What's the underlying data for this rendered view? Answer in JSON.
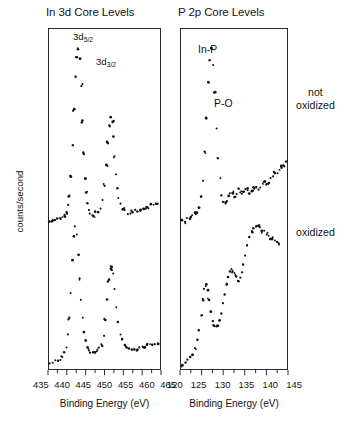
{
  "figure": {
    "ylabel": "counts/second",
    "side_labels": [
      {
        "id": "not-oxidized",
        "text": "not\noxidized",
        "line1": "not",
        "line2": "oxidized"
      },
      {
        "id": "oxidized",
        "text": "oxidized",
        "line1": "oxidized",
        "line2": ""
      }
    ]
  },
  "panels": {
    "left": {
      "title": "In 3d Core Levels",
      "xlabel": "Binding Energy (eV)",
      "annotations": [
        {
          "name": "3d-five-halves",
          "base": "3d",
          "sub": "5/2"
        },
        {
          "name": "3d-three-halves",
          "base": "3d",
          "sub": "3/2"
        }
      ],
      "ticklabels": [
        "435",
        "440",
        "445",
        "450",
        "455",
        "460",
        "465"
      ]
    },
    "right": {
      "title": "P 2p Core Levels",
      "xlabel": "Binding Energy (eV)",
      "annotations": [
        {
          "name": "in-p",
          "text": "In-P"
        },
        {
          "name": "p-o",
          "text": "P-O"
        }
      ],
      "ticklabels": [
        "120",
        "125",
        "130",
        "135",
        "140",
        "145"
      ]
    }
  },
  "chart_data": {
    "type": "scatter",
    "ylabel": "counts/second",
    "grid": false,
    "legend": "none",
    "marker_color": "#111111",
    "panels": [
      {
        "name": "In 3d Core Levels",
        "xlabel": "Binding Energy (eV)",
        "xlim": [
          435,
          465
        ],
        "xticks": [
          435,
          440,
          445,
          450,
          455,
          460,
          465
        ],
        "annotations": [
          {
            "label": "3d5/2",
            "x": 445.0
          },
          {
            "label": "3d3/2",
            "x": 452.5
          }
        ],
        "series": [
          {
            "name": "not oxidized",
            "offset": "upper",
            "x": [
              435.2,
              435.9,
              436.6,
              437.3,
              438.0,
              438.6,
              439.2,
              439.7,
              440.2,
              440.6,
              441.0,
              441.4,
              441.8,
              442.1,
              442.5,
              442.9,
              443.3,
              443.7,
              444.1,
              444.4,
              444.7,
              445.0,
              445.3,
              445.7,
              446.1,
              446.6,
              447.1,
              447.6,
              448.2,
              448.8,
              449.4,
              450.0,
              450.5,
              451.0,
              451.4,
              451.8,
              452.1,
              452.4,
              452.7,
              453.0,
              453.4,
              453.8,
              454.3,
              454.9,
              455.5,
              456.2,
              456.9,
              457.6,
              458.3,
              459.0,
              459.7,
              460.4,
              461.1,
              461.8,
              462.5,
              463.2,
              463.9,
              464.5
            ],
            "y": [
              6,
              6,
              6,
              7,
              7,
              8,
              9,
              11,
              14,
              19,
              28,
              44,
              62,
              78,
              88,
              92,
              88,
              74,
              56,
              40,
              28,
              20,
              15,
              12,
              10,
              9,
              9,
              10,
              11,
              13,
              17,
              24,
              34,
              45,
              54,
              58,
              56,
              48,
              38,
              29,
              22,
              17,
              14,
              12,
              11,
              10,
              10,
              10,
              11,
              11,
              12,
              12,
              13,
              13,
              14,
              14,
              15,
              15
            ]
          },
          {
            "name": "oxidized",
            "offset": "lower",
            "x": [
              435.2,
              436.0,
              436.8,
              437.5,
              438.1,
              438.7,
              439.2,
              439.7,
              440.1,
              440.5,
              440.9,
              441.3,
              441.7,
              442.1,
              442.5,
              442.9,
              443.3,
              443.7,
              444.1,
              444.5,
              444.9,
              445.3,
              445.7,
              446.2,
              446.8,
              447.4,
              448.0,
              448.6,
              449.2,
              449.8,
              450.3,
              450.8,
              451.2,
              451.6,
              452.0,
              452.4,
              452.8,
              453.2,
              453.7,
              454.2,
              454.8,
              455.4,
              456.0,
              456.7,
              457.4,
              458.1,
              458.8,
              459.5,
              460.2,
              460.9,
              461.6,
              462.3,
              463.0,
              463.7,
              464.4
            ],
            "y": [
              5,
              5,
              6,
              6,
              7,
              8,
              10,
              13,
              18,
              26,
              38,
              52,
              63,
              68,
              64,
              55,
              44,
              34,
              26,
              20,
              16,
              13,
              11,
              10,
              10,
              10,
              11,
              12,
              14,
              18,
              25,
              34,
              43,
              49,
              50,
              46,
              39,
              31,
              24,
              19,
              16,
              14,
              13,
              12,
              12,
              12,
              12,
              13,
              13,
              13,
              14,
              14,
              14,
              14,
              14
            ]
          }
        ]
      },
      {
        "name": "P 2p Core Levels",
        "xlabel": "Binding Energy (eV)",
        "xlim": [
          120,
          145
        ],
        "xticks": [
          120,
          125,
          130,
          135,
          140,
          145
        ],
        "annotations": [
          {
            "label": "In-P",
            "x": 126.5
          },
          {
            "label": "P-O",
            "x": 133.0
          }
        ],
        "series": [
          {
            "name": "not oxidized",
            "offset": "upper",
            "x": [
              120.3,
              120.9,
              121.5,
              122.1,
              122.7,
              123.3,
              123.8,
              124.3,
              124.8,
              125.2,
              125.6,
              126.0,
              126.4,
              126.8,
              127.2,
              127.6,
              128.0,
              128.4,
              128.8,
              129.2,
              129.6,
              130.0,
              130.4,
              130.8,
              131.2,
              131.6,
              132.0,
              132.4,
              132.8,
              133.2,
              133.6,
              134.0,
              134.4,
              134.8,
              135.2,
              135.7,
              136.2,
              136.7,
              137.2,
              137.7,
              138.2,
              138.7,
              139.2,
              139.7,
              140.2,
              140.7,
              141.2,
              141.7,
              142.2,
              142.7,
              143.2,
              143.7,
              144.2,
              144.7
            ],
            "y": [
              12,
              12,
              13,
              13,
              14,
              15,
              16,
              18,
              22,
              29,
              40,
              54,
              68,
              78,
              82,
              76,
              64,
              50,
              38,
              29,
              23,
              20,
              19,
              20,
              22,
              23,
              24,
              23,
              22,
              23,
              25,
              24,
              23,
              24,
              25,
              24,
              23,
              24,
              25,
              26,
              25,
              26,
              27,
              28,
              27,
              28,
              29,
              30,
              31,
              32,
              33,
              34,
              35,
              36
            ]
          },
          {
            "name": "oxidized",
            "offset": "lower",
            "x": [
              120.3,
              121.0,
              121.6,
              122.2,
              122.8,
              123.3,
              123.8,
              124.3,
              124.7,
              125.1,
              125.5,
              125.9,
              126.3,
              126.7,
              127.1,
              127.5,
              127.9,
              128.3,
              128.7,
              129.1,
              129.5,
              129.9,
              130.3,
              130.7,
              131.1,
              131.5,
              131.9,
              132.3,
              132.7,
              133.1,
              133.5,
              133.9,
              134.3,
              134.7,
              135.1,
              135.6,
              136.1,
              136.6,
              137.1,
              137.6,
              138.1,
              138.6,
              139.1,
              139.6,
              140.1,
              140.6,
              141.1,
              141.6,
              142.1,
              142.6,
              143.1
            ],
            "y": [
              8,
              9,
              10,
              11,
              13,
              16,
              20,
              26,
              34,
              42,
              48,
              50,
              47,
              42,
              36,
              31,
              28,
              27,
              28,
              31,
              35,
              40,
              45,
              50,
              54,
              57,
              58,
              57,
              55,
              53,
              52,
              53,
              56,
              60,
              65,
              70,
              74,
              77,
              79,
              80,
              80,
              79,
              78,
              77,
              76,
              75,
              74,
              73,
              72,
              71,
              70
            ]
          }
        ]
      }
    ]
  }
}
